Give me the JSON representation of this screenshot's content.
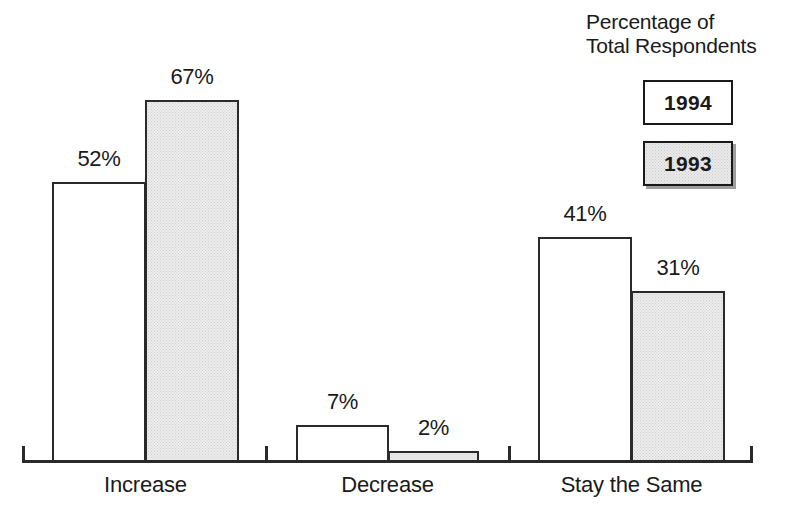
{
  "legend": {
    "title_line1": "Percentage of",
    "title_line2": "Total Respondents",
    "keys": [
      {
        "label": "1994",
        "style": "white"
      },
      {
        "label": "1993",
        "style": "shaded"
      }
    ]
  },
  "axis": {
    "categories": [
      "Increase",
      "Decrease",
      "Stay the Same"
    ]
  },
  "labels": {
    "increase_1994": "52%",
    "increase_1993": "67%",
    "decrease_1994": "7%",
    "decrease_1993": "2%",
    "stay_1994": "41%",
    "stay_1993": "31%"
  },
  "colors": {
    "ink": "#1a1a1a",
    "axis": "#2a2a2a",
    "bar_white_fill": "#ffffff",
    "bar_shaded_fill": "#ececec",
    "bar_shaded_dot": "#cfcfcf",
    "background": "#ffffff"
  },
  "chart_data": {
    "type": "bar",
    "title": "Percentage of Total Respondents",
    "xlabel": "",
    "ylabel": "Percentage of Total Respondents",
    "categories": [
      "Increase",
      "Decrease",
      "Stay the Same"
    ],
    "series": [
      {
        "name": "1994",
        "values": [
          52,
          7,
          41
        ],
        "fill": "white",
        "value_labels": [
          "52%",
          "7%",
          "41%"
        ]
      },
      {
        "name": "1993",
        "values": [
          67,
          2,
          31
        ],
        "fill": "shaded-stipple",
        "value_labels": [
          "67%",
          "2%",
          "31%"
        ]
      }
    ],
    "ylim": [
      0,
      67
    ],
    "grid": false,
    "y_axis_visible": false,
    "x_axis_visible": true,
    "data_labels": true,
    "legend_position": "top-right",
    "units": "percent"
  }
}
